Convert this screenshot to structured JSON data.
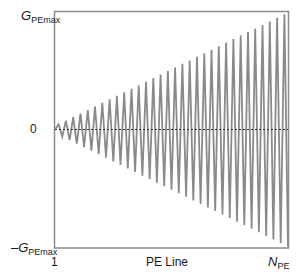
{
  "chart_data": {
    "type": "line",
    "title": "",
    "xlabel": "PE Line",
    "ylabel": "",
    "x_ticks": [
      "1",
      "N_PE"
    ],
    "y_ticks": [
      "G_PEmax",
      "0",
      "-G_PEmax"
    ],
    "ylim": [
      -1,
      1
    ],
    "xlim": [
      1,
      32
    ],
    "grid": false,
    "legend": null,
    "annotations": [
      "dashed zero reference line"
    ],
    "series": [
      {
        "name": "phase-encoding gradient amplitude (normalized)",
        "cycles": 32,
        "amplitude_start": 0.03,
        "amplitude_end": 1.0,
        "color": "#8a8a8a"
      }
    ]
  },
  "labels": {
    "ymax_main": "G",
    "ymax_sub": "PEmax",
    "zero": "0",
    "ymin_main": "–G",
    "ymin_sub": "PEmax",
    "x_start": "1",
    "x_label": "PE Line",
    "x_end_main": "N",
    "x_end_sub": "PE"
  },
  "colors": {
    "frame": "#8c8c8c",
    "wave": "#8a8a8a",
    "zero_line": "#333333",
    "text": "#1a1a1a"
  }
}
